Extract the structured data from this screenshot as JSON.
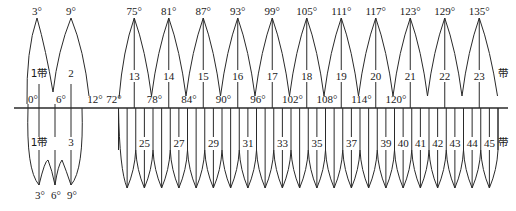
{
  "diagram": {
    "zone_suffix": "带",
    "upper": {
      "description": "6-degree zones",
      "left_group": {
        "central_meridians": [
          "3°",
          "9°"
        ],
        "boundaries": [
          "0°",
          "6°",
          "12°"
        ],
        "zone_labels": [
          "1带",
          "2"
        ]
      },
      "right_group": {
        "central_meridians": [
          "75°",
          "81°",
          "87°",
          "93°",
          "99°",
          "105°",
          "111°",
          "117°",
          "123°",
          "129°",
          "135°"
        ],
        "boundaries": [
          "72°",
          "78°",
          "84°",
          "90°",
          "96°",
          "102°",
          "108°",
          "114°",
          "120°"
        ],
        "zone_labels": [
          "13",
          "14",
          "15",
          "16",
          "17",
          "18",
          "19",
          "20",
          "21",
          "22",
          "23"
        ],
        "end_label": "带"
      }
    },
    "lower": {
      "description": "3-degree zones",
      "left_group": {
        "central_meridians": [
          "3°",
          "6°",
          "9°"
        ],
        "zone_labels": [
          "1带",
          "3"
        ]
      },
      "right_group": {
        "zone_labels": [
          "25",
          "27",
          "29",
          "31",
          "33",
          "35",
          "37",
          "39",
          "40",
          "41",
          "42",
          "43",
          "44",
          "45"
        ],
        "end_label": "带"
      }
    }
  }
}
